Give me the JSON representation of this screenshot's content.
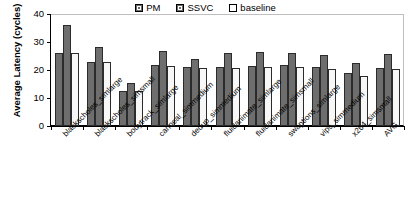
{
  "chart_data": {
    "type": "bar",
    "title": "",
    "xlabel": "",
    "ylabel": "Average Latency (cycles)",
    "ylim": [
      0,
      40
    ],
    "yticks": [
      0,
      10,
      20,
      30,
      40
    ],
    "grid": false,
    "legend_position": "top-center",
    "categories": [
      "blackscholes_simlarge",
      "blackscholes_simsmall",
      "bodytrack_simlarge",
      "canneal_simmedium",
      "dedup_simmedium",
      "fluidanimate_simlarge",
      "fluidanimate_simsmall",
      "swaptions_simlarge",
      "vips_simmedium",
      "x264_simsmall",
      "AVG"
    ],
    "series": [
      {
        "name": "PM",
        "color": "#6e6e6e",
        "values": [
          26.0,
          23.0,
          12.5,
          21.8,
          21.0,
          21.0,
          21.5,
          21.7,
          20.9,
          18.8,
          20.7
        ]
      },
      {
        "name": "SSVC",
        "color": "#6e6e6e",
        "values": [
          36.2,
          28.2,
          15.5,
          26.8,
          24.0,
          26.1,
          26.3,
          26.2,
          25.3,
          22.6,
          25.6
        ]
      },
      {
        "name": "baseline",
        "color": "#f7f7f7",
        "values": [
          26.0,
          22.8,
          12.4,
          21.5,
          20.8,
          20.8,
          21.1,
          21.2,
          20.3,
          18.0,
          20.4
        ]
      }
    ]
  },
  "legend": {
    "items": [
      {
        "label": "PM",
        "swatch": "filled-square-icon"
      },
      {
        "label": "SSVC",
        "swatch": "filled-square-icon"
      },
      {
        "label": "baseline",
        "swatch": "empty-square-icon"
      }
    ]
  },
  "axes": {
    "y_title": "Average Latency (cycles)",
    "y_tick_labels": [
      "40",
      "30",
      "20",
      "10",
      "0"
    ]
  }
}
